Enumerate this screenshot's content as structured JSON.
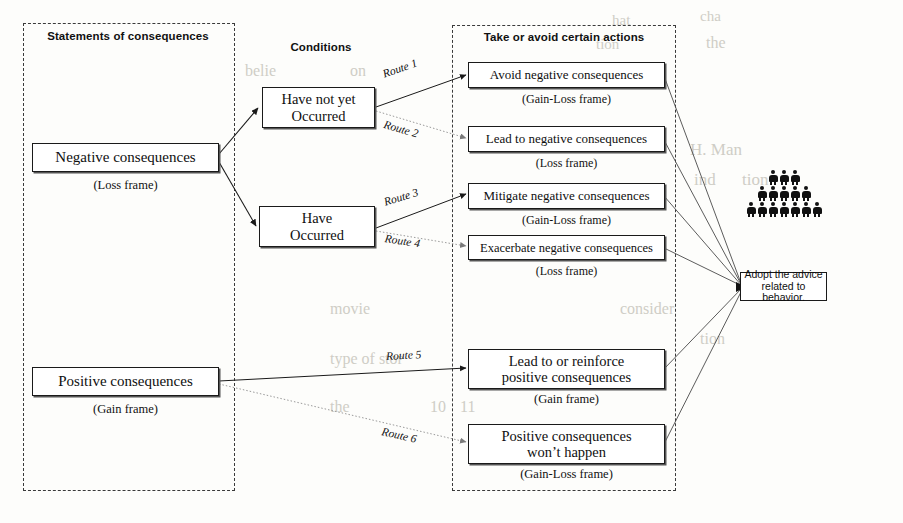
{
  "groups": [
    {
      "title": "Statements of consequences"
    },
    {
      "title": "Conditions"
    },
    {
      "title": "Take or avoid certain actions"
    }
  ],
  "statements": [
    {
      "label": "Negative consequences",
      "frame": "(Loss frame)"
    },
    {
      "label": "Positive consequences",
      "frame": "(Gain frame)"
    }
  ],
  "conditions": [
    {
      "line1": "Have not yet",
      "line2": "Occurred"
    },
    {
      "line1": "Have",
      "line2": "Occurred"
    }
  ],
  "actions": [
    {
      "line1": "Avoid negative consequences",
      "line2": "",
      "frame": "(Gain-Loss frame)"
    },
    {
      "line1": "Lead to negative consequences",
      "line2": "",
      "frame": "(Loss frame)"
    },
    {
      "line1": "Mitigate negative consequences",
      "line2": "",
      "frame": "(Gain-Loss frame)"
    },
    {
      "line1": "Exacerbate negative consequences",
      "line2": "",
      "frame": "(Loss frame)"
    },
    {
      "line1": "Lead to or reinforce",
      "line2": "positive consequences",
      "frame": "(Gain frame)"
    },
    {
      "line1": "Positive consequences",
      "line2": "won’t happen",
      "frame": "(Gain-Loss frame)"
    }
  ],
  "routes": [
    {
      "label": "Route 1"
    },
    {
      "label": "Route 2"
    },
    {
      "label": "Route 3"
    },
    {
      "label": "Route 4"
    },
    {
      "label": "Route 5"
    },
    {
      "label": "Route 6"
    }
  ],
  "outcome": {
    "line1": "Adopt the advice",
    "line2": "related to behavior."
  },
  "people": {
    "rows": [
      3,
      5,
      7
    ]
  },
  "colors": {
    "ink": "#111111",
    "box_border": "#1a1a1a",
    "dashed": "#3a3a3a",
    "bleed": "#cfcdc6"
  },
  "bleed_text": [
    {
      "t": "hat",
      "x": 612,
      "y": 12,
      "s": 15
    },
    {
      "t": "cha",
      "x": 700,
      "y": 8,
      "s": 15
    },
    {
      "t": "tion",
      "x": 596,
      "y": 36,
      "s": 15
    },
    {
      "t": "the",
      "x": 706,
      "y": 34,
      "s": 16
    },
    {
      "t": "belie",
      "x": 245,
      "y": 62,
      "s": 16
    },
    {
      "t": "on",
      "x": 350,
      "y": 62,
      "s": 16
    },
    {
      "t": "both",
      "x": 470,
      "y": 62,
      "s": 16
    },
    {
      "t": "o th",
      "x": 580,
      "y": 62,
      "s": 16
    },
    {
      "t": "H. Man",
      "x": 690,
      "y": 140,
      "s": 17
    },
    {
      "t": "ind",
      "x": 694,
      "y": 170,
      "s": 17
    },
    {
      "t": "tion",
      "x": 742,
      "y": 170,
      "s": 17
    },
    {
      "t": "movie",
      "x": 330,
      "y": 300,
      "s": 16
    },
    {
      "t": "consider",
      "x": 620,
      "y": 300,
      "s": 16
    },
    {
      "t": "tion",
      "x": 700,
      "y": 330,
      "s": 16
    },
    {
      "t": "type of stor",
      "x": 330,
      "y": 350,
      "s": 16
    },
    {
      "t": "the",
      "x": 330,
      "y": 398,
      "s": 16
    },
    {
      "t": "10",
      "x": 430,
      "y": 398,
      "s": 16
    },
    {
      "t": "11",
      "x": 460,
      "y": 398,
      "s": 16
    }
  ]
}
